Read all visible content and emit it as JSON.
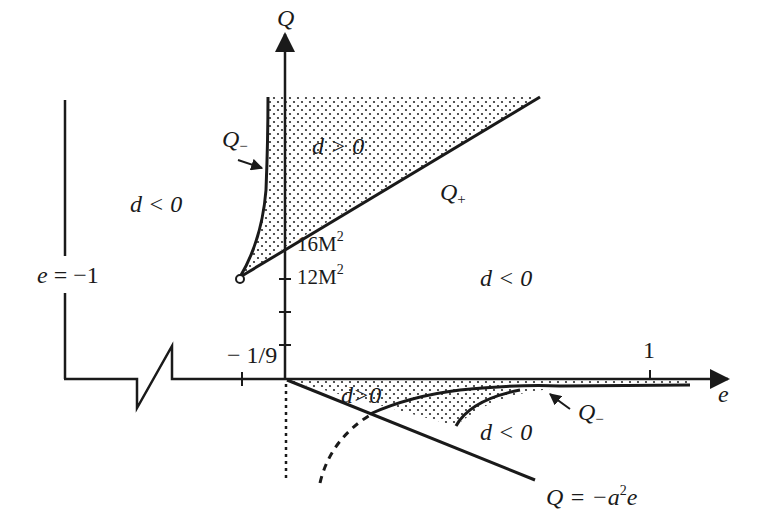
{
  "figure": {
    "type": "region-diagram",
    "axes": {
      "horizontal": {
        "label": "e",
        "ticks": [
          {
            "label": "− 1/9",
            "value": -0.111
          },
          {
            "label": "1",
            "value": 1
          }
        ]
      },
      "vertical": {
        "label": "Q",
        "ticks": [
          {
            "label": "16M",
            "sup": "2"
          },
          {
            "label": "12M",
            "sup": "2"
          }
        ]
      }
    },
    "boundary_line": {
      "label_left": "e",
      "label_eq": "= −1"
    },
    "curves": {
      "q_minus_upper": {
        "main": "Q",
        "sub": "−"
      },
      "q_plus": {
        "main": "Q",
        "sub": "+"
      },
      "q_minus_lower": {
        "main": "Q",
        "sub": "−"
      },
      "line": {
        "main": "Q = −a",
        "sup": "2",
        "tail": "e"
      }
    },
    "regions": {
      "upper_shaded": "d > 0",
      "upper_left": "d < 0",
      "right_middle": "d < 0",
      "lower_shaded": "d>0",
      "lower_right": "d < 0"
    },
    "colors": {
      "ink": "#1a1a1a",
      "background": "#ffffff",
      "dots": "#2a2a2a"
    }
  }
}
